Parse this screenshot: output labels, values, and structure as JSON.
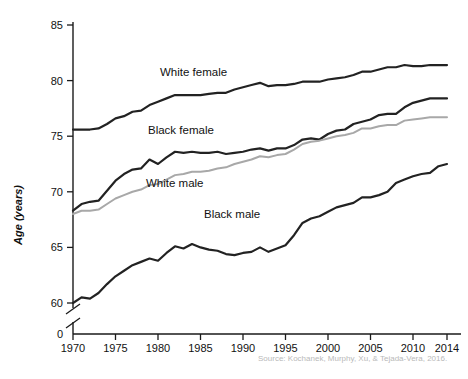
{
  "figure": {
    "source_note": "Source: Kochanek, Murphy, Xu, & Tejada-Vera, 2016.",
    "ylabel": "Age (years)"
  },
  "labels": {
    "white_female": "White female",
    "black_female": "Black female",
    "white_male": "White male",
    "black_male": "Black male"
  },
  "colors": {
    "dark_line": "#222222",
    "gray_line": "#a8a8a8",
    "axis": "#1a1a1a",
    "source_text": "#b9b9b9"
  },
  "chart_data": {
    "type": "line",
    "title": "",
    "xlabel": "",
    "ylabel": "Age (years)",
    "xlim": [
      1970,
      2014
    ],
    "ylim": [
      59,
      85.6
    ],
    "grid": false,
    "legend": "inline-labels",
    "axis_break": true,
    "axis_break_note": "y-axis broken between 0 and 60",
    "ytick_labels": [
      "0",
      "60",
      "65",
      "70",
      "75",
      "80",
      "85"
    ],
    "yticks": [
      60,
      65,
      70,
      75,
      80,
      85
    ],
    "xticks": [
      1970,
      1975,
      1980,
      1985,
      1990,
      1995,
      2000,
      2005,
      2010,
      2014
    ],
    "xtick_labels": [
      "1970",
      "1975",
      "1980",
      "1985",
      "1990",
      "1995",
      "2000",
      "2005",
      "2010",
      "2014"
    ],
    "x": [
      1970,
      1971,
      1972,
      1973,
      1974,
      1975,
      1976,
      1977,
      1978,
      1979,
      1980,
      1981,
      1982,
      1983,
      1984,
      1985,
      1986,
      1987,
      1988,
      1989,
      1990,
      1991,
      1992,
      1993,
      1994,
      1995,
      1996,
      1997,
      1998,
      1999,
      2000,
      2001,
      2002,
      2003,
      2004,
      2005,
      2006,
      2007,
      2008,
      2009,
      2010,
      2011,
      2012,
      2013,
      2014
    ],
    "series": [
      {
        "name": "White female",
        "color": "#222222",
        "values": [
          75.6,
          75.6,
          75.6,
          75.7,
          76.1,
          76.6,
          76.8,
          77.2,
          77.3,
          77.8,
          78.1,
          78.4,
          78.7,
          78.7,
          78.7,
          78.7,
          78.8,
          78.9,
          78.9,
          79.2,
          79.4,
          79.6,
          79.8,
          79.5,
          79.6,
          79.6,
          79.7,
          79.9,
          79.9,
          79.9,
          80.1,
          80.2,
          80.3,
          80.5,
          80.8,
          80.8,
          81.0,
          81.2,
          81.2,
          81.4,
          81.3,
          81.3,
          81.4,
          81.4,
          81.4
        ]
      },
      {
        "name": "Black female",
        "color": "#222222",
        "values": [
          68.3,
          68.9,
          69.1,
          69.2,
          70.1,
          71.0,
          71.6,
          72.0,
          72.1,
          72.9,
          72.5,
          73.1,
          73.6,
          73.5,
          73.6,
          73.5,
          73.5,
          73.6,
          73.4,
          73.5,
          73.6,
          73.8,
          73.9,
          73.7,
          73.9,
          73.9,
          74.2,
          74.7,
          74.8,
          74.7,
          75.2,
          75.5,
          75.6,
          76.1,
          76.3,
          76.5,
          76.9,
          77.0,
          77.0,
          77.6,
          78.0,
          78.2,
          78.4,
          78.4,
          78.4
        ]
      },
      {
        "name": "White male",
        "color": "#a8a8a8",
        "values": [
          68.0,
          68.3,
          68.3,
          68.4,
          68.9,
          69.4,
          69.7,
          70.0,
          70.2,
          70.6,
          70.7,
          71.1,
          71.5,
          71.6,
          71.8,
          71.8,
          71.9,
          72.1,
          72.2,
          72.5,
          72.7,
          72.9,
          73.2,
          73.1,
          73.3,
          73.4,
          73.8,
          74.3,
          74.5,
          74.6,
          74.8,
          75.0,
          75.1,
          75.3,
          75.7,
          75.7,
          75.9,
          76.0,
          76.0,
          76.4,
          76.5,
          76.6,
          76.7,
          76.7,
          76.7
        ]
      },
      {
        "name": "Black male",
        "color": "#222222",
        "values": [
          60.0,
          60.5,
          60.4,
          60.9,
          61.7,
          62.4,
          62.9,
          63.4,
          63.7,
          64.0,
          63.8,
          64.5,
          65.1,
          64.9,
          65.3,
          65.0,
          64.8,
          64.7,
          64.4,
          64.3,
          64.5,
          64.6,
          65.0,
          64.6,
          64.9,
          65.2,
          66.1,
          67.2,
          67.6,
          67.8,
          68.2,
          68.6,
          68.8,
          69.0,
          69.5,
          69.5,
          69.7,
          70.0,
          70.8,
          71.1,
          71.4,
          71.6,
          71.7,
          72.3,
          72.5
        ]
      }
    ]
  }
}
